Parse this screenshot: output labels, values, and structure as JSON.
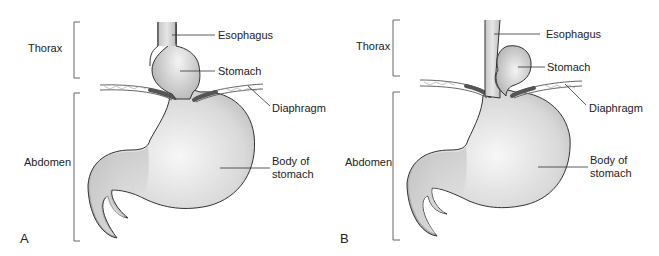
{
  "figure": {
    "panels": [
      {
        "id": "A",
        "label": "A",
        "regions": {
          "upper": "Thorax",
          "lower": "Abdomen"
        },
        "callouts": {
          "esophagus": "Esophagus",
          "stomach": "Stomach",
          "diaphragm": "Diaphragm",
          "body_line1": "Body of",
          "body_line2": "stomach"
        }
      },
      {
        "id": "B",
        "label": "B",
        "regions": {
          "upper": "Thorax",
          "lower": "Abdomen"
        },
        "callouts": {
          "esophagus": "Esophagus",
          "stomach": "Stomach",
          "diaphragm": "Diaphragm",
          "body_line1": "Body of",
          "body_line2": "stomach"
        }
      }
    ]
  },
  "colors": {
    "organ_fill_light": "#f2f2f2",
    "organ_fill_dark": "#b8b8b8",
    "diaphragm": "#777777",
    "outline": "#333333"
  }
}
